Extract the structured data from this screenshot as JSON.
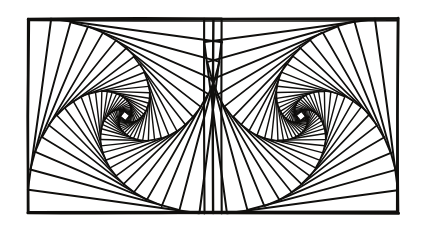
{
  "figure": {
    "kind": "geometric-line-drawing",
    "medium": "pen-and-ink line art",
    "canvas": {
      "width": 426,
      "height": 236
    },
    "colors": {
      "paper": "#ffffff",
      "ink": "#100f0d",
      "ink_light": "#2a2724"
    },
    "frame": {
      "label": "outer-rectangle",
      "x": 28,
      "y": 19,
      "width": 370,
      "height": 194,
      "stroke_width": 2.6,
      "divider_x": 213,
      "divider_stroke_width": 2.4,
      "jitter": 0.9
    },
    "panels": [
      {
        "name": "left-panel",
        "x": 28,
        "y": 19,
        "size": 194,
        "handedness": "clockwise",
        "mirrored": false,
        "spiral_center": {
          "x": 118,
          "y": 119
        },
        "cusp": {
          "x": 213,
          "y": 56
        }
      },
      {
        "name": "right-panel",
        "x": 204,
        "y": 19,
        "size": 194,
        "handedness": "counter-clockwise",
        "mirrored": true,
        "spiral_center": {
          "x": 300,
          "y": 121
        },
        "cusp": {
          "x": 213,
          "y": 56
        }
      }
    ],
    "spiral": {
      "description": "Nested squares, each inscribed in the previous with a constant fractional offset along every edge, producing a logarithmic whirling-squares spiral.",
      "iterations": 30,
      "step_fraction": 0.118,
      "stroke_width": 2.1,
      "inner_stroke_width": 1.6,
      "jitter": 0.55,
      "start_rotation_deg": 0
    }
  }
}
